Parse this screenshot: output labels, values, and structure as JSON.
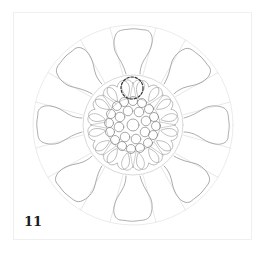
{
  "figure": {
    "step_number": "11",
    "highlight": "dashed circle marking a small petal detail near the top of the center",
    "colors": {
      "line": "#9a9a9a",
      "guide": "#d6d6d6",
      "dashed_highlight": "#333333",
      "step_label": "#1a1a1a",
      "frame_border": "#f0f0f0"
    },
    "geometry": {
      "center": [
        133,
        125
      ],
      "outer_circle_radius": 100,
      "inner_circle_radius": 50,
      "seed_radius": 28,
      "large_petal_count": 8,
      "small_petal_count": 16,
      "highlight_center": [
        132,
        88
      ],
      "highlight_radius": 11
    }
  }
}
